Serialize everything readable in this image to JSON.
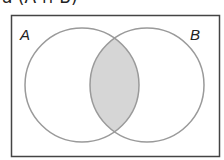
{
  "caption": "a (A ∩ B)",
  "diagram": {
    "type": "venn",
    "sets": [
      {
        "label": "A",
        "cx": 82,
        "cy": 85,
        "r": 57
      },
      {
        "label": "B",
        "cx": 147,
        "cy": 85,
        "r": 57
      }
    ],
    "shaded_region": "A ∩ B",
    "colors": {
      "frame": "#444444",
      "circle_stroke": "#9a9a9a",
      "shade_fill": "#d6d6d6"
    }
  }
}
